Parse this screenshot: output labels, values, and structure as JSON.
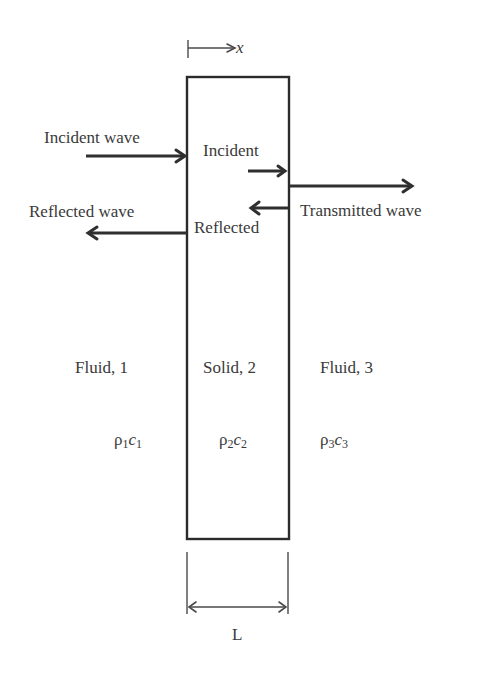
{
  "diagram": {
    "axis": {
      "label": "x"
    },
    "labels": {
      "incident_wave": "Incident wave",
      "reflected_wave": "Reflected wave",
      "incident_inner": "Incident",
      "reflected_inner": "Reflected",
      "transmitted_wave": "Transmitted wave"
    },
    "regions": [
      {
        "name": "Fluid, 1",
        "impedance_base": "ρ",
        "impedance_sub1": "1",
        "impedance_c": "c",
        "impedance_sub2": "1"
      },
      {
        "name": "Solid, 2",
        "impedance_base": "ρ",
        "impedance_sub1": "2",
        "impedance_c": "c",
        "impedance_sub2": "2"
      },
      {
        "name": "Fluid, 3",
        "impedance_base": "ρ",
        "impedance_sub1": "3",
        "impedance_c": "c",
        "impedance_sub2": "3"
      }
    ],
    "dimension": {
      "label": "L"
    },
    "colors": {
      "stroke": "#2b2b2b",
      "text": "#3a3a3a",
      "background": "#ffffff"
    }
  }
}
